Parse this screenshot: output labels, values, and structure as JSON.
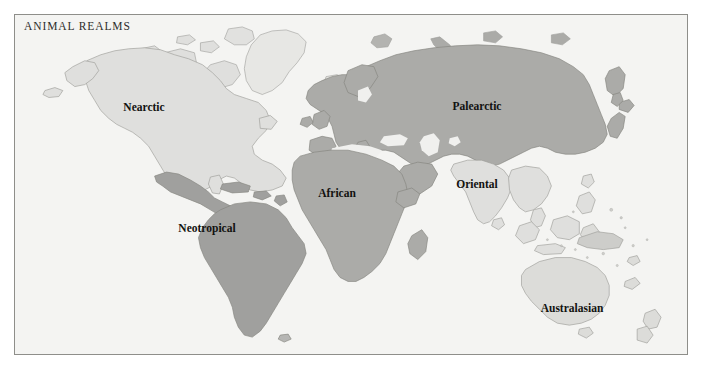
{
  "map": {
    "title": "ANIMAL REALMS",
    "background_color": "#f4f4f2",
    "frame_color": "#8e8e8a",
    "coastline_color": "#9a9a96",
    "projection_note": "world map, equirectangular-like",
    "realms": [
      {
        "name": "nearctic",
        "label": "Nearctic",
        "fill": "#dededc",
        "label_x": 129,
        "label_y": 92
      },
      {
        "name": "neotropical",
        "label": "Neotropical",
        "fill": "#9d9d9b",
        "label_x": 192,
        "label_y": 213
      },
      {
        "name": "palearctic",
        "label": "Palearctic",
        "fill": "#a8a8a5",
        "label_x": 462,
        "label_y": 91
      },
      {
        "name": "african",
        "label": "African",
        "fill": "#a8a8a5",
        "label_x": 322,
        "label_y": 178
      },
      {
        "name": "oriental",
        "label": "Oriental",
        "fill": "#dededc",
        "label_x": 462,
        "label_y": 169
      },
      {
        "name": "australasian",
        "label": "Australasian",
        "fill": "#dbdbd8",
        "label_x": 557,
        "label_y": 293
      }
    ],
    "unclassified_fill": "#e3e3e0"
  }
}
